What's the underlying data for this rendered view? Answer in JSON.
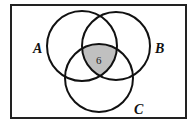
{
  "diagram": {
    "type": "venn",
    "sets": [
      {
        "label": "A",
        "cx": 82,
        "cy": 46,
        "r": 35
      },
      {
        "label": "B",
        "cx": 116,
        "cy": 46,
        "r": 34
      },
      {
        "label": "C",
        "cx": 99,
        "cy": 78,
        "r": 34
      }
    ],
    "shaded_region": {
      "sets": [
        "A",
        "B",
        "C"
      ],
      "value": "6",
      "color": "#c0c0c0"
    },
    "universe_rect": {
      "x": 11,
      "y": 5,
      "w": 175,
      "h": 113
    }
  }
}
